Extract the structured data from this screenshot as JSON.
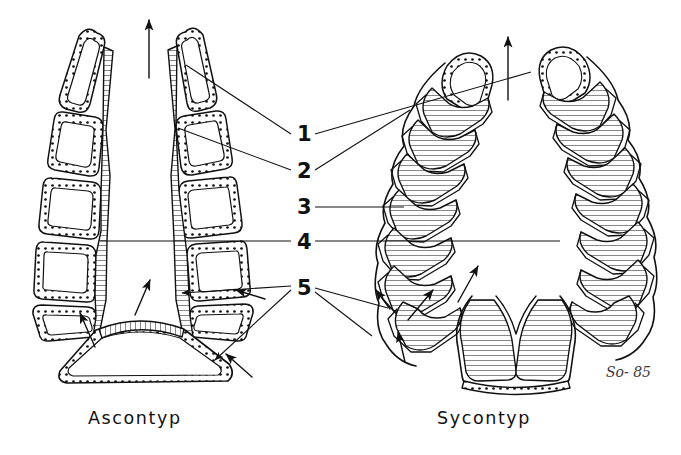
{
  "figure": {
    "title_left": "Ascontyp",
    "title_right": "Sycontyp",
    "signature": "So- 85",
    "background_color": "#ffffff",
    "ink_color": "#111111"
  },
  "labels": {
    "items": [
      {
        "id": 1,
        "text": "1"
      },
      {
        "id": 2,
        "text": "2"
      },
      {
        "id": 3,
        "text": "3"
      },
      {
        "id": 4,
        "text": "4"
      },
      {
        "id": 5,
        "text": "5"
      }
    ]
  },
  "diagram_data": {
    "type": "schematic-cross-section",
    "subject": "sponge body plan comparison",
    "panels": [
      {
        "name": "ascon",
        "caption": "Ascontyp",
        "wall_cell_count_per_side": 7,
        "chamber_shape": "rounded-quadrilateral",
        "inner_layer_texture": "hatched",
        "outer_layer_texture": "dotted",
        "has_basal_chamber": true,
        "flow_arrow_direction": "up",
        "inflow_arrow_count": 4
      },
      {
        "name": "sycon",
        "caption": "Sycontyp",
        "radial_chamber_count_per_side": 8,
        "chamber_shape": "hourglass-radial",
        "inner_layer_texture": "hatched",
        "outer_layer_texture": "dotted",
        "has_basal_chamber": true,
        "flow_arrow_direction": "up",
        "inflow_arrow_count": 4
      }
    ],
    "leader_lines": [
      {
        "label": "1",
        "targets": [
          "ascon-apex-cell",
          "sycon-apex-chamber"
        ]
      },
      {
        "label": "2",
        "targets": [
          "ascon-upper-wall",
          "sycon-upper-chamber"
        ]
      },
      {
        "label": "3",
        "targets": [
          "sycon-mid-chamber"
        ]
      },
      {
        "label": "4",
        "targets": [
          "ascon-lumen",
          "sycon-lumen"
        ]
      },
      {
        "label": "5",
        "targets": [
          "ascon-outer-wall",
          "sycon-outer-wall"
        ]
      }
    ]
  }
}
